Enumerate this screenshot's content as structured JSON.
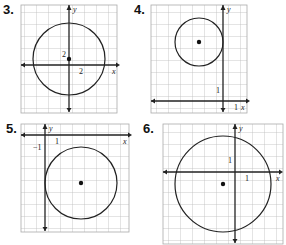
{
  "problems": [
    {
      "number": "3.",
      "axis_x": "x",
      "axis_y": "y",
      "tick_x": "2",
      "tick_y": "2",
      "center": [
        0,
        1
      ],
      "radius": 6,
      "grid_unit": 2
    },
    {
      "number": "4.",
      "axis_x": "x",
      "axis_y": "y",
      "tick_x": "1",
      "tick_y": "1",
      "center": [
        -2,
        5
      ],
      "radius": 2,
      "grid_unit": 1
    },
    {
      "number": "5.",
      "axis_x": "x",
      "axis_y": "y",
      "tick_x": "1",
      "tick_y": "−1",
      "center": [
        3,
        -4
      ],
      "radius": 3,
      "grid_unit": 1
    },
    {
      "number": "6.",
      "axis_x": "x",
      "axis_y": "y",
      "tick_x": "1",
      "tick_y": "1",
      "center": [
        -1,
        -1
      ],
      "radius": 4,
      "grid_unit": 1
    }
  ],
  "colors": {
    "grid": "#bbbbbb",
    "axis": "#222222",
    "circle": "#222222",
    "border": "#aaaaaa"
  }
}
